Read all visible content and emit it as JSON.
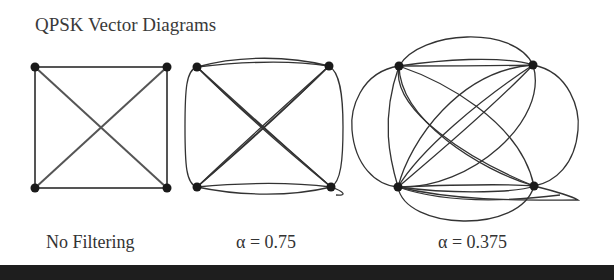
{
  "title": "QPSK Vector Diagrams",
  "diagrams": [
    {
      "label": "No Filtering",
      "label_x": 44,
      "corners": [
        [
          35,
          67
        ],
        [
          167,
          67
        ],
        [
          167,
          188
        ],
        [
          35,
          188
        ]
      ]
    },
    {
      "label": "α = 0.75",
      "label_x": 236,
      "corners": [
        [
          197,
          67
        ],
        [
          329,
          66
        ],
        [
          331,
          187
        ],
        [
          197,
          187
        ]
      ]
    },
    {
      "label": "α = 0.375",
      "label_x": 438,
      "corners": [
        [
          399,
          66
        ],
        [
          533,
          65
        ],
        [
          534,
          186
        ],
        [
          398,
          187
        ]
      ]
    }
  ],
  "colors": {
    "line": "#333333",
    "dot": "#1a1a1a",
    "bar": "#1e1e1e"
  }
}
